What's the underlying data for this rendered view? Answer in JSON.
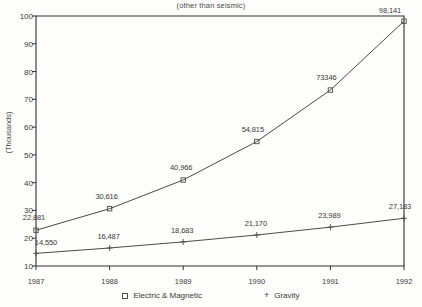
{
  "chart_data": {
    "type": "line",
    "title": "",
    "subtitle": "(other than seismic)",
    "xlabel": "",
    "ylabel": "(Thousands)",
    "categories": [
      "1987",
      "1988",
      "1989",
      "1990",
      "1991",
      "1992"
    ],
    "ylim": [
      10,
      100
    ],
    "yticks": [
      "100",
      "90",
      "80",
      "70",
      "60",
      "50",
      "40",
      "30",
      "20",
      "10"
    ],
    "ytick_values": [
      100,
      90,
      80,
      70,
      60,
      50,
      40,
      30,
      20,
      10
    ],
    "grid": false,
    "legend_position": "bottom",
    "units": "thousands",
    "series": [
      {
        "name": "Electric & Magnetic",
        "marker": "square",
        "values": [
          22881,
          30616,
          40966,
          54815,
          73346,
          98141
        ],
        "plot_values": [
          22.881,
          30.616,
          40.966,
          54.815,
          73.346,
          98.141
        ],
        "labels": [
          "22,881",
          "30,616",
          "40,966",
          "54,815",
          "73346",
          "98,141"
        ]
      },
      {
        "name": "Gravity",
        "marker": "plus",
        "values": [
          14550,
          16487,
          18683,
          21170,
          23989,
          27183
        ],
        "plot_values": [
          14.55,
          16.487,
          18.683,
          21.17,
          23.989,
          27.183
        ],
        "labels": [
          "14,550",
          "16,487",
          "18,683",
          "21,170",
          "23,989",
          "27,183"
        ]
      }
    ]
  },
  "legend": {
    "entries": [
      {
        "marker": "square-marker",
        "label": "Electric & Magnetic"
      },
      {
        "marker": "plus-marker",
        "label": "Gravity"
      }
    ]
  },
  "colors": {
    "line": "#4a4a4a",
    "axis": "#2f2f2f",
    "text": "#3a3a3a",
    "background": "#fdfdfb"
  }
}
